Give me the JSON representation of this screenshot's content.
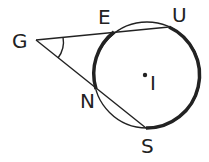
{
  "diagram": {
    "type": "circle-secants",
    "circle": {
      "cx": 147,
      "cy": 75,
      "r": 53,
      "center_label": "I"
    },
    "points": {
      "G": {
        "x": 36,
        "y": 40,
        "label": "G"
      },
      "E": {
        "x": 114,
        "y": 32,
        "label": "E"
      },
      "U": {
        "x": 169,
        "y": 27,
        "label": "U"
      },
      "N": {
        "x": 96,
        "y": 89,
        "label": "N"
      },
      "S": {
        "x": 146,
        "y": 128,
        "label": "S"
      }
    },
    "labels": {
      "G": "G",
      "E": "E",
      "U": "U",
      "N": "N",
      "S": "S",
      "I": "I"
    },
    "stroke_color": "#222222"
  }
}
